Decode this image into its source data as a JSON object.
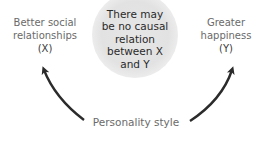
{
  "diagram": {
    "type": "causal-diagram",
    "nodes": {
      "x": {
        "label": "Better social relationships",
        "line1": "Better social",
        "line2": "relationships",
        "var": "(X)"
      },
      "y": {
        "label": "Greater happiness",
        "line1": "Greater",
        "line2": "happiness",
        "var": "(Y)"
      },
      "cause": {
        "label": "Personality style"
      }
    },
    "note": {
      "lines": [
        "There may",
        "be no causal",
        "relation",
        "between X",
        "and Y"
      ]
    },
    "edges": [
      {
        "from": "Personality style",
        "to": "Better social relationships (X)"
      },
      {
        "from": "Personality style",
        "to": "Greater happiness (Y)"
      }
    ],
    "colors": {
      "arrow": "#2b2b2b",
      "node_text": "#6a6a6a",
      "note_bg": "#e4e4e4"
    }
  }
}
